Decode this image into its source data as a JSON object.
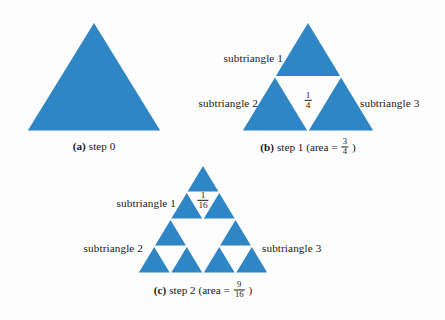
{
  "figure": {
    "background_color": "#fdfdfd",
    "fill_color": "#2f86c5",
    "text_color": "#1a1a1a"
  },
  "panels": [
    {
      "id": "panel-a",
      "tag": "(a)",
      "caption_text": "step 0",
      "caption_area_prefix": "",
      "depth": 0,
      "geometry": {
        "apex_x": 94,
        "apex_y": 22,
        "base_y": 131,
        "half_width": 67
      },
      "caption_pos": {
        "x": 94,
        "y": 146
      },
      "labels": [],
      "fractions": []
    },
    {
      "id": "panel-b",
      "tag": "(b)",
      "caption_text": "step 1 (area =",
      "caption_area_numerator": "3",
      "caption_area_denominator": "4",
      "caption_suffix": ")",
      "depth": 1,
      "geometry": {
        "apex_x": 308,
        "apex_y": 22,
        "base_y": 131,
        "half_width": 66
      },
      "caption_pos": {
        "x": 308,
        "y": 147
      },
      "labels": [
        {
          "name": "subtriangle-1",
          "text": "subtriangle 1",
          "x": 283,
          "y": 58,
          "anchor": "right"
        },
        {
          "name": "subtriangle-2",
          "text": "subtriangle 2",
          "x": 258,
          "y": 103,
          "anchor": "right"
        },
        {
          "name": "subtriangle-3",
          "text": "subtriangle 3",
          "x": 360,
          "y": 103,
          "anchor": "left"
        }
      ],
      "fractions": [
        {
          "name": "area-fraction-quarter",
          "numerator": "1",
          "denominator": "4",
          "x": 308,
          "y": 101
        }
      ]
    },
    {
      "id": "panel-c",
      "tag": "(c)",
      "caption_text": "step 2 (area =",
      "caption_area_numerator": "9",
      "caption_area_denominator": "16",
      "caption_suffix": ")",
      "depth": 2,
      "geometry": {
        "apex_x": 203,
        "apex_y": 165,
        "base_y": 273,
        "half_width": 65
      },
      "caption_pos": {
        "x": 203,
        "y": 290
      },
      "labels": [
        {
          "name": "subtriangle-1",
          "text": "subtriangle 1",
          "x": 176,
          "y": 203,
          "anchor": "right"
        },
        {
          "name": "subtriangle-2",
          "text": "subtriangle 2",
          "x": 143,
          "y": 248,
          "anchor": "right"
        },
        {
          "name": "subtriangle-3",
          "text": "subtriangle 3",
          "x": 262,
          "y": 248,
          "anchor": "left"
        }
      ],
      "fractions": [
        {
          "name": "area-fraction-sixteenth",
          "numerator": "1",
          "denominator": "16",
          "x": 203,
          "y": 201
        }
      ]
    }
  ]
}
